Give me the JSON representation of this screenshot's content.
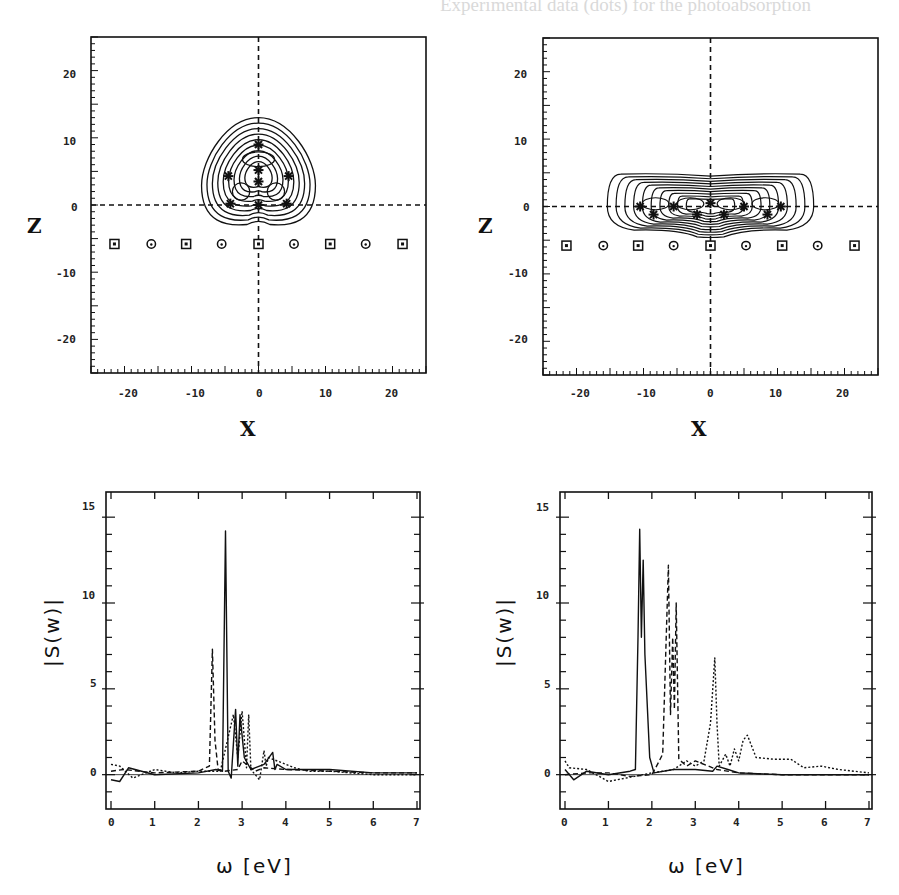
{
  "background_text": {
    "left_column": [
      "Experimental data (dots) for the photoabsorption",
      "strength ... with ... expected ... to have",
      "as the TDLDA results.",
      "",
      "see [3]. In ... we use here a small",
      "we stay ... regime with about",
      "excitation ... The calculation uses",
      "time steps up to 40 fs.",
      "",
      "3. Results",
      "",
      "Its ground state. For Na9+ we find the",
      "configuration of Na9+ as illustrated in",
      "shape is similar to the one found for",
      "ses a larger ... complex ... structure. In any",
      "extra it is not possible to control the",
      "the clusters in a laser field. We ...",
      "the ... response ... of ... configuration. ...",
      "... we ... the ...",
      "... cluster ...",
      "... excitation ... a ...",
      "... we ... find ... response ...",
      "course. Fig. 1 shows the dipole strength",
      "Na9+ compared with TDLDA ..."
    ],
    "right_column": [
      "dependent Thomas-Fermi model (TDTF)",
      "... kinetic energy is evaluated as",
      "(2)",
      "represents ... and",
      "is the usual ... functional",
      "... form for the kinetic energy yields",
      "... dynamical description of the moving",
      "... at the price, however, that single",
      "... the TDTF ...",
      "... Schrodinger equation with the",
      "... Kohn-Sham ...",
      "... fields are represented on a",
      "... grid in three dimensions spaced",
      "... Poisson equation is solved with the",
      "... and Reinhard ... The Kohn-",
      "... is computed with damped gradient",
      "... The electronic time ... spaced ... split",
      "... and ... propagation in ...",
      "... by ...",
      "... measurements ... the",
      "... spectral ...",
      "dipole moment D(t) is Fourier trans-",
      "... D(w). The photoabsorption strength"
    ]
  },
  "figures": {
    "contour_left": {
      "xlabel": "X",
      "ylabel": "Z",
      "xticks": [
        "-20",
        "-10",
        "0",
        "10",
        "20"
      ],
      "yticks": [
        "20",
        "10",
        "0",
        "-10",
        "-20"
      ]
    },
    "contour_right": {
      "xlabel": "X",
      "ylabel": "Z",
      "xticks": [
        "-20",
        "-10",
        "0",
        "10",
        "20"
      ],
      "yticks": [
        "20",
        "10",
        "0",
        "-10",
        "-20"
      ]
    },
    "spectrum_left": {
      "xlabel": "ω  [eV]",
      "ylabel": "|S(w)|",
      "xticks": [
        "0",
        "1",
        "2",
        "3",
        "4",
        "5",
        "6",
        "7"
      ],
      "yticks": [
        "15",
        "10",
        "5",
        "0"
      ]
    },
    "spectrum_right": {
      "xlabel": "ω  [eV]",
      "ylabel": "|S(w)|",
      "xticks": [
        "0",
        "1",
        "2",
        "3",
        "4",
        "5",
        "6",
        "7"
      ],
      "yticks": [
        "15",
        "10",
        "5",
        "0"
      ]
    }
  },
  "chart_data": [
    {
      "type": "contour",
      "title": "",
      "xlabel": "X",
      "ylabel": "Z",
      "xlim": [
        -25,
        25
      ],
      "ylim": [
        -25,
        25
      ],
      "grid": false,
      "reference_lines": [
        {
          "axis": "x",
          "value": 0,
          "style": "dashed"
        },
        {
          "axis": "y",
          "value": 0,
          "style": "dashed"
        }
      ],
      "description": "Pyramidal/triangular electron density contours centered near x=0, extending z from about -3 to 13; ions (stars) at approximately (0,9),(0,5),(0,3),(-4.5,4),(4.5,4),(-4.5,0),(0,0),(4.5,0)",
      "contour_extent": {
        "x": [
          -8.5,
          8.5
        ],
        "z": [
          -3.2,
          13
        ]
      },
      "ion_positions": [
        [
          0,
          9
        ],
        [
          0,
          5.2
        ],
        [
          0,
          3.5
        ],
        [
          -4.5,
          4.3
        ],
        [
          4.5,
          4.3
        ],
        [
          -4.2,
          0.2
        ],
        [
          0,
          0
        ],
        [
          4.2,
          0.2
        ]
      ],
      "surface_markers": {
        "z": -5.8,
        "x": [
          -21.5,
          -16,
          -10.8,
          -5.5,
          0,
          5.3,
          10.7,
          16,
          21.5
        ],
        "symbols": [
          "square",
          "circle",
          "square",
          "circle",
          "square",
          "circle",
          "square",
          "circle",
          "square"
        ]
      }
    },
    {
      "type": "contour",
      "title": "",
      "xlabel": "X",
      "ylabel": "Z",
      "xlim": [
        -25,
        25
      ],
      "ylim": [
        -25,
        25
      ],
      "grid": false,
      "reference_lines": [
        {
          "axis": "x",
          "value": 0,
          "style": "dashed"
        },
        {
          "axis": "y",
          "value": 0,
          "style": "dashed"
        }
      ],
      "description": "Elongated flat electron density contours lying along z=0, extending x from about -15 to 15 and z from about -4.5 to 4.8; ions (stars) along the x-axis",
      "contour_extent": {
        "x": [
          -15.3,
          15.5
        ],
        "z": [
          -4.5,
          4.8
        ]
      },
      "ion_positions": [
        [
          -10.5,
          0
        ],
        [
          -5.5,
          0
        ],
        [
          0,
          0.5
        ],
        [
          5,
          0
        ],
        [
          10.5,
          0
        ],
        [
          -8.5,
          -1.2
        ],
        [
          -2,
          -1.2
        ],
        [
          2,
          -1.2
        ],
        [
          8.5,
          -1.2
        ]
      ],
      "surface_markers": {
        "z": -5.8,
        "x": [
          -21.5,
          -16,
          -10.8,
          -5.5,
          0,
          5.3,
          10.7,
          16,
          21.5
        ],
        "symbols": [
          "square",
          "circle",
          "square",
          "circle",
          "square",
          "circle",
          "square",
          "circle",
          "square"
        ]
      }
    },
    {
      "type": "line",
      "title": "",
      "xlabel": "ω [eV]",
      "ylabel": "|S(w)|",
      "xlim": [
        0,
        7
      ],
      "ylim": [
        -2,
        16
      ],
      "xticks": [
        0,
        1,
        2,
        3,
        4,
        5,
        6,
        7
      ],
      "yticks": [
        0,
        5,
        10,
        15
      ],
      "grid": false,
      "series": [
        {
          "name": "solid",
          "style": "solid",
          "x": [
            0,
            0.2,
            0.4,
            1.0,
            2.0,
            2.4,
            2.55,
            2.62,
            2.68,
            2.75,
            2.85,
            2.9,
            2.95,
            3.05,
            3.2,
            3.5,
            3.7,
            3.75,
            3.8,
            4.0,
            4.5,
            5.0,
            6.0,
            7.0
          ],
          "y": [
            -0.3,
            -0.4,
            0.4,
            0.0,
            0.1,
            0.3,
            0.2,
            14.2,
            0.2,
            -0.2,
            3.8,
            0.5,
            3.5,
            1.0,
            0.3,
            0.6,
            1.3,
            0.3,
            0.6,
            0.3,
            0.3,
            0.3,
            0.1,
            0.1
          ]
        },
        {
          "name": "dashed",
          "style": "dashed",
          "x": [
            0,
            0.3,
            1.0,
            2.0,
            2.25,
            2.32,
            2.38,
            2.45,
            2.6,
            2.9,
            3.0,
            3.3,
            3.5,
            4.0,
            5.0,
            6.0,
            7.0
          ],
          "y": [
            0.2,
            0.3,
            0.1,
            0.2,
            0.5,
            7.3,
            2.0,
            0.3,
            0.2,
            0.3,
            0.8,
            0.2,
            0.4,
            0.3,
            0.2,
            0.1,
            0.1
          ]
        },
        {
          "name": "dotted",
          "style": "dotted",
          "x": [
            0,
            0.2,
            0.5,
            1.0,
            1.5,
            2.0,
            2.5,
            2.8,
            2.9,
            3.0,
            3.1,
            3.15,
            3.2,
            3.4,
            3.5,
            3.55,
            3.6,
            4.0,
            4.2,
            4.5,
            5.0,
            6.0,
            7.0
          ],
          "y": [
            0.6,
            0.5,
            -0.2,
            0.3,
            0.1,
            0.2,
            0.2,
            3.5,
            1.0,
            3.7,
            0.4,
            3.5,
            0.3,
            -0.3,
            1.4,
            0.5,
            1.0,
            0.6,
            0.4,
            0.2,
            0.2,
            0.0,
            0.0
          ]
        }
      ]
    },
    {
      "type": "line",
      "title": "",
      "xlabel": "ω [eV]",
      "ylabel": "|S(w)|",
      "xlim": [
        0,
        7
      ],
      "ylim": [
        -2,
        16
      ],
      "xticks": [
        0,
        1,
        2,
        3,
        4,
        5,
        6,
        7
      ],
      "yticks": [
        0,
        5,
        10,
        15
      ],
      "grid": false,
      "series": [
        {
          "name": "solid",
          "style": "solid",
          "x": [
            0,
            0.2,
            0.5,
            1.0,
            1.5,
            1.62,
            1.68,
            1.72,
            1.76,
            1.8,
            1.84,
            1.95,
            2.05,
            2.5,
            3.0,
            3.4,
            3.5,
            3.75,
            4.0,
            5.0,
            6.0,
            7.0
          ],
          "y": [
            0.3,
            -0.3,
            0.2,
            0.0,
            0.2,
            0.3,
            8.0,
            14.3,
            8.0,
            12.5,
            7.0,
            1.0,
            0.1,
            0.3,
            0.3,
            0.2,
            0.5,
            0.3,
            0.1,
            0.0,
            0.0,
            0.0
          ]
        },
        {
          "name": "dashed",
          "style": "dashed",
          "x": [
            0,
            0.5,
            1.0,
            1.5,
            2.0,
            2.15,
            2.25,
            2.38,
            2.43,
            2.48,
            2.52,
            2.56,
            2.62,
            2.8,
            3.0,
            3.5,
            4.0,
            5.0,
            6.0,
            7.0
          ],
          "y": [
            0.0,
            0.1,
            0.1,
            -0.1,
            0.0,
            0.7,
            1.2,
            12.2,
            3.5,
            8.0,
            3.8,
            10.0,
            0.9,
            0.5,
            0.8,
            0.3,
            0.1,
            0.0,
            0.0,
            0.0
          ]
        },
        {
          "name": "dotted",
          "style": "dotted",
          "x": [
            0,
            0.1,
            0.5,
            1.0,
            2.0,
            2.5,
            2.8,
            3.0,
            3.2,
            3.35,
            3.45,
            3.5,
            3.55,
            3.7,
            3.8,
            3.9,
            4.0,
            4.1,
            4.2,
            4.4,
            4.8,
            5.2,
            5.5,
            5.9,
            6.3,
            7.0
          ],
          "y": [
            0.8,
            0.4,
            0.3,
            -0.4,
            0.1,
            0.3,
            0.8,
            0.5,
            0.8,
            3.0,
            6.8,
            3.0,
            0.5,
            1.2,
            0.5,
            1.5,
            0.8,
            2.0,
            2.3,
            1.0,
            0.9,
            0.9,
            0.4,
            0.5,
            0.3,
            0.1
          ]
        }
      ]
    }
  ]
}
